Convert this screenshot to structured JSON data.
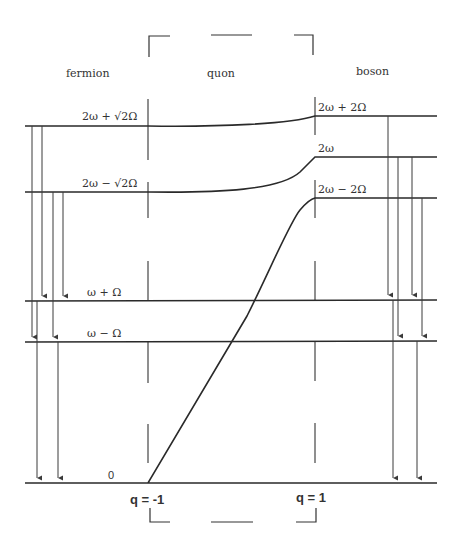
{
  "diagram": {
    "sections": {
      "fermion": "fermion",
      "quon": "quon",
      "boson": "boson"
    },
    "fermion_levels": [
      {
        "label": "2ω + √2Ω"
      },
      {
        "label": "2ω − √2Ω"
      },
      {
        "label": "ω + Ω"
      },
      {
        "label": "ω − Ω"
      },
      {
        "label": "0"
      }
    ],
    "boson_levels": [
      {
        "label": "2ω + 2Ω"
      },
      {
        "label": "2ω"
      },
      {
        "label": "2ω − 2Ω"
      }
    ],
    "q_labels": {
      "left": "q = -1",
      "right": "q = 1"
    },
    "colors": {
      "line": "#2a2a2a",
      "background": "#ffffff"
    }
  }
}
